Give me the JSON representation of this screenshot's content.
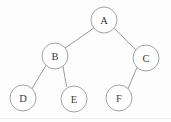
{
  "diagram": {
    "type": "binary-tree",
    "background_color": "#fdfdfd",
    "stroke_color": "#9a9a9a",
    "label_color": "#3a3a3a",
    "node_radius": 13,
    "nodes": [
      {
        "id": "A",
        "label": "A",
        "cx": 104,
        "cy": 20,
        "r": 13,
        "role": "root",
        "depth": 0
      },
      {
        "id": "B",
        "label": "B",
        "cx": 55,
        "cy": 56,
        "r": 13,
        "role": "left-child",
        "depth": 1,
        "parent": "A"
      },
      {
        "id": "C",
        "label": "C",
        "cx": 146,
        "cy": 58,
        "r": 13,
        "role": "right-child",
        "depth": 1,
        "parent": "A"
      },
      {
        "id": "D",
        "label": "D",
        "cx": 23,
        "cy": 98,
        "r": 13,
        "role": "left-child",
        "depth": 2,
        "parent": "B"
      },
      {
        "id": "E",
        "label": "E",
        "cx": 74,
        "cy": 99,
        "r": 13,
        "role": "right-child",
        "depth": 2,
        "parent": "B"
      },
      {
        "id": "F",
        "label": "F",
        "cx": 119,
        "cy": 98,
        "r": 13,
        "role": "left-child",
        "depth": 2,
        "parent": "C"
      }
    ],
    "edges": [
      {
        "id": "A-B",
        "from": "A",
        "to": "B",
        "side": "left",
        "x1": 93.8,
        "y1": 28.0,
        "x2": 65.2,
        "y2": 48.0
      },
      {
        "id": "A-C",
        "from": "A",
        "to": "C",
        "side": "right",
        "x1": 114.2,
        "y1": 28.0,
        "x2": 135.8,
        "y2": 50.0
      },
      {
        "id": "B-D",
        "from": "B",
        "to": "D",
        "side": "left",
        "x1": 46.0,
        "y1": 65.4,
        "x2": 32.0,
        "y2": 88.6
      },
      {
        "id": "B-E",
        "from": "B",
        "to": "E",
        "side": "right",
        "x1": 63.0,
        "y1": 66.4,
        "x2": 66.6,
        "y2": 86.4
      },
      {
        "id": "C-F",
        "from": "C",
        "to": "F",
        "side": "left",
        "x1": 137.0,
        "y1": 67.4,
        "x2": 128.0,
        "y2": 88.6
      }
    ],
    "artifacts": [
      {
        "id": "scan-line",
        "type": "horizontal-line",
        "x1": 0,
        "y1": 118.5,
        "x2": 171,
        "y2": 118.5,
        "color": "#e2e2e2"
      }
    ]
  }
}
